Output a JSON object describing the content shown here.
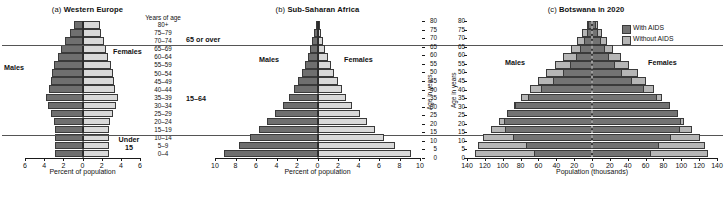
{
  "figure": {
    "background": "#ffffff",
    "colors": {
      "male": "#6f6f6f",
      "female": "#d9d9d9",
      "with_aids": "#737373",
      "without_aids": "#b6b6b6",
      "axis": "#1a1a1a",
      "divider": "#555555"
    }
  },
  "panels": [
    {
      "id": "a",
      "tag": "(a)",
      "title": "Western Europe",
      "male_label": "Males",
      "female_label": "Females",
      "age_header": "Years of age",
      "xlabel": "Percent of population",
      "xticks": [
        "6",
        "4",
        "2",
        "0",
        "2",
        "4",
        "6"
      ],
      "category_labels": [
        "65 or over",
        "15–64",
        "Under\n15"
      ],
      "category_65_label": "65 or over",
      "category_1564_label": "15–64",
      "category_under15_label_line1": "Under",
      "category_under15_label_line2": "15",
      "age_groups": [
        "80+",
        "75–79",
        "70–74",
        "65–69",
        "60–64",
        "55–59",
        "50–54",
        "45–49",
        "40–44",
        "35–39",
        "30–34",
        "25–29",
        "20–24",
        "15–19",
        "10–14",
        "5–9",
        "0–4"
      ]
    },
    {
      "id": "b",
      "tag": "(b)",
      "title": "Sub-Saharan Africa",
      "male_label": "Males",
      "female_label": "Females",
      "xlabel": "Percent of population",
      "xticks": [
        "10",
        "8",
        "6",
        "4",
        "2",
        "0",
        "2",
        "4",
        "6",
        "8",
        "10"
      ],
      "ylabel": "Age in years",
      "yticks": [
        "80",
        "75",
        "70",
        "65",
        "60",
        "55",
        "50",
        "45",
        "40",
        "35",
        "30",
        "25",
        "20",
        "15",
        "10",
        "5",
        "0"
      ]
    },
    {
      "id": "c",
      "tag": "(c)",
      "title": "Botswana in 2020",
      "male_label": "Males",
      "female_label": "Females",
      "xlabel": "Population (thousands)",
      "xticks": [
        "140",
        "120",
        "100",
        "80",
        "60",
        "40",
        "20",
        "0",
        "20",
        "40",
        "60",
        "80",
        "100",
        "120",
        "140"
      ],
      "ylabel": "Age in years",
      "yticks": [
        "80",
        "75",
        "70",
        "65",
        "60",
        "55",
        "50",
        "45",
        "40",
        "35",
        "30",
        "25",
        "20",
        "15",
        "10",
        "5",
        "0"
      ],
      "legend": [
        {
          "label": "With AIDS",
          "color": "#737373"
        },
        {
          "label": "Without AIDS",
          "color": "#b6b6b6"
        }
      ]
    }
  ],
  "chart_data": [
    {
      "type": "bar",
      "subtype": "population-pyramid",
      "panel": "a",
      "title": "(a) Western Europe",
      "xlabel": "Percent of population",
      "ylabel": "Years of age",
      "xlim": [
        -6,
        6
      ],
      "xticks": [
        6,
        4,
        2,
        0,
        2,
        4,
        6
      ],
      "grid": false,
      "legend": [
        "Males",
        "Females"
      ],
      "legend_position": "inside",
      "categories": [
        "0–4",
        "5–9",
        "10–14",
        "15–19",
        "20–24",
        "25–29",
        "30–34",
        "35–39",
        "40–44",
        "45–49",
        "50–54",
        "55–59",
        "60–64",
        "65–69",
        "70–74",
        "75–79",
        "80+"
      ],
      "series": [
        {
          "name": "Males",
          "values": [
            2.9,
            2.9,
            2.9,
            2.9,
            3.0,
            3.3,
            3.6,
            3.8,
            3.5,
            3.3,
            3.2,
            3.0,
            2.6,
            2.2,
            1.8,
            1.3,
            0.9
          ]
        },
        {
          "name": "Females",
          "values": [
            2.8,
            2.8,
            2.8,
            2.8,
            2.9,
            3.2,
            3.5,
            3.7,
            3.4,
            3.3,
            3.2,
            3.0,
            2.7,
            2.4,
            2.2,
            1.9,
            1.8
          ]
        }
      ],
      "annotations": [
        "65 or over",
        "15–64",
        "Under 15"
      ]
    },
    {
      "type": "bar",
      "subtype": "population-pyramid",
      "panel": "b",
      "title": "(b) Sub-Saharan Africa",
      "xlabel": "Percent of population",
      "ylabel": "Age in years",
      "xlim": [
        -10,
        10
      ],
      "xticks": [
        10,
        8,
        6,
        4,
        2,
        0,
        2,
        4,
        6,
        8,
        10
      ],
      "grid": false,
      "legend": [
        "Males",
        "Females"
      ],
      "legend_position": "inside",
      "categories": [
        "0–4",
        "5–9",
        "10–14",
        "15–19",
        "20–24",
        "25–29",
        "30–34",
        "35–39",
        "40–44",
        "45–49",
        "50–54",
        "55–59",
        "60–64",
        "65–69",
        "70–74",
        "75–79",
        "80+"
      ],
      "series": [
        {
          "name": "Males",
          "values": [
            9.1,
            7.7,
            6.6,
            5.7,
            4.9,
            4.1,
            3.4,
            2.8,
            2.3,
            1.9,
            1.5,
            1.2,
            0.95,
            0.7,
            0.5,
            0.3,
            0.15
          ]
        },
        {
          "name": "Females",
          "values": [
            9.1,
            7.6,
            6.5,
            5.6,
            4.8,
            4.1,
            3.4,
            2.8,
            2.4,
            2.0,
            1.6,
            1.3,
            1.0,
            0.75,
            0.55,
            0.35,
            0.2
          ]
        }
      ]
    },
    {
      "type": "bar",
      "subtype": "population-pyramid-overlay",
      "panel": "c",
      "title": "(c) Botswana in 2020",
      "xlabel": "Population (thousands)",
      "ylabel": "Age in years",
      "xlim": [
        -140,
        140
      ],
      "xticks": [
        140,
        120,
        100,
        80,
        60,
        40,
        20,
        0,
        20,
        40,
        60,
        80,
        100,
        120,
        140
      ],
      "grid": false,
      "legend": [
        "With AIDS",
        "Without AIDS"
      ],
      "legend_position": "top-right",
      "categories": [
        "0–4",
        "5–9",
        "10–14",
        "15–19",
        "20–24",
        "25–29",
        "30–34",
        "35–39",
        "40–44",
        "45–49",
        "50–54",
        "55–59",
        "60–64",
        "65–69",
        "70–74",
        "75–79",
        "80+"
      ],
      "series": [
        {
          "name": "Males without AIDS",
          "values": [
            131,
            128,
            122,
            113,
            104,
            95,
            87,
            79,
            70,
            61,
            52,
            42,
            33,
            24,
            17,
            11,
            6
          ]
        },
        {
          "name": "Males with AIDS",
          "values": [
            65,
            74,
            88,
            97,
            99,
            95,
            86,
            72,
            57,
            44,
            33,
            25,
            18,
            13,
            9,
            6,
            4
          ]
        },
        {
          "name": "Females without AIDS",
          "values": [
            130,
            127,
            121,
            112,
            103,
            94,
            86,
            78,
            69,
            60,
            51,
            41,
            32,
            24,
            17,
            11,
            7
          ]
        },
        {
          "name": "Females with AIDS",
          "values": [
            66,
            75,
            89,
            98,
            100,
            96,
            87,
            73,
            58,
            45,
            34,
            26,
            19,
            14,
            10,
            7,
            5
          ]
        }
      ]
    }
  ]
}
